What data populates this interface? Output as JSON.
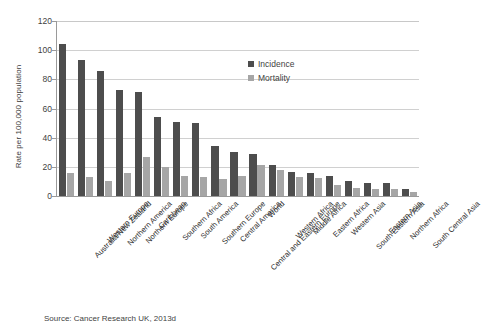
{
  "chart_data": {
    "type": "bar",
    "title": "",
    "xlabel": "",
    "ylabel": "Rate per 100,000 population",
    "ylim": [
      0,
      120
    ],
    "ytick_step": 20,
    "yticks": [
      0,
      20,
      40,
      60,
      80,
      100,
      120
    ],
    "grid": true,
    "legend_position": "top-right-inside",
    "categories": [
      "Australia/New Zealand",
      "Western Europe",
      "Northern America",
      "Northern Europe",
      "Caribbean",
      "Southern Africa",
      "South America",
      "Southern Europe",
      "Central America",
      "Central and Eastern Europe",
      "World",
      "Western Africa",
      "Middle Africa",
      "Eastern Africa",
      "Western Asia",
      "South Eastern Asia",
      "Eastern Asia",
      "Northern Africa",
      "South Central Asia"
    ],
    "series": [
      {
        "name": "Incidence",
        "color": "#4d4d4d",
        "values": [
          104,
          93,
          85.5,
          73,
          71,
          54,
          50.5,
          50,
          34,
          30,
          29,
          21,
          16.5,
          15.5,
          14,
          10,
          9,
          9,
          5
        ]
      },
      {
        "name": "Mortality",
        "color": "#a6a6a6",
        "values": [
          16,
          13,
          10,
          16,
          26.5,
          20,
          14,
          13,
          12,
          14,
          21,
          17.5,
          13,
          12.5,
          7.5,
          5.5,
          4.5,
          4.5,
          2.5
        ]
      }
    ]
  },
  "legend": {
    "items": [
      {
        "label": "Incidence",
        "color": "#4d4d4d"
      },
      {
        "label": "Mortality",
        "color": "#a6a6a6"
      }
    ]
  },
  "axis": {
    "y_title": "Rate per 100,000 population",
    "tick_labels": [
      "120",
      "100",
      "80",
      "60",
      "40",
      "20",
      "0"
    ]
  },
  "footer": {
    "source": "Source: Cancer Research UK, 2013d"
  }
}
